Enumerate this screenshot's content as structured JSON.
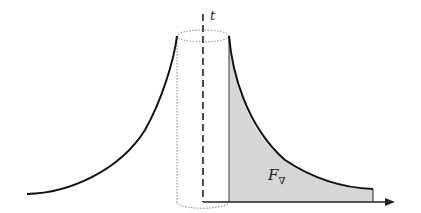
{
  "figure": {
    "axis_label": "t",
    "area_label": "F",
    "area_label_subscript": "∇",
    "colors": {
      "curve": "#111111",
      "fill": "#d6d6d6",
      "cylinder": "#888888",
      "axis": "#222222"
    }
  }
}
